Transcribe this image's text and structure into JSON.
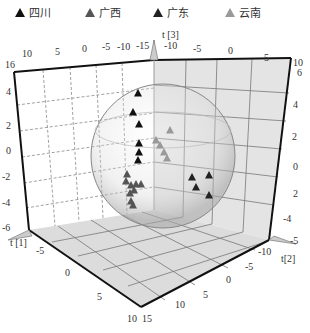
{
  "legend": [
    {
      "label": "四川",
      "color": "#111111"
    },
    {
      "label": "广西",
      "color": "#555555"
    },
    {
      "label": "广东",
      "color": "#222222"
    },
    {
      "label": "云南",
      "color": "#999999"
    }
  ],
  "axes": {
    "t1_label": "t [1]",
    "t2_label": "t[2]",
    "t3_label": "t [3]"
  },
  "chart_data": {
    "type": "scatter",
    "title": "",
    "dimensions": 3,
    "xlabel": "t[1]",
    "ylabel": "t[2]",
    "zlabel": "t[3]",
    "xlim": [
      -6,
      16
    ],
    "ylim": [
      -15,
      15
    ],
    "zlim": [
      -6,
      6
    ],
    "x_ticks_back": [
      "16",
      "10",
      "5",
      "0",
      "-5",
      "-10",
      "-15"
    ],
    "top_right_ticks": [
      "-10",
      "-5",
      "0",
      "5",
      "10"
    ],
    "left_z_ticks": [
      "4",
      "2",
      "0",
      "-2",
      "-4",
      "-6"
    ],
    "right_z_ticks": [
      "6",
      "4",
      "2",
      "0",
      "2",
      "-4",
      "-5"
    ],
    "bottom_t1_ticks": [
      "-5",
      "0",
      "5",
      "10"
    ],
    "bottom_t2_ticks": [
      "-10",
      "-5",
      "0",
      "5",
      "10",
      "15"
    ],
    "legend_position": "top",
    "grid": true,
    "confidence_ellipsoid": true,
    "series": [
      {
        "name": "四川",
        "color": "#111111",
        "points_2d": [
          [
            138,
            93
          ],
          [
            133,
            112
          ],
          [
            139,
            124
          ],
          [
            139,
            143
          ],
          [
            139,
            152
          ],
          [
            138,
            160
          ]
        ]
      },
      {
        "name": "广西",
        "color": "#555555",
        "points_2d": [
          [
            127,
            174
          ],
          [
            126,
            181
          ],
          [
            131,
            185
          ],
          [
            136,
            184
          ],
          [
            141,
            184
          ],
          [
            134,
            190
          ],
          [
            130,
            193
          ],
          [
            131,
            201
          ],
          [
            133,
            205
          ]
        ]
      },
      {
        "name": "广东",
        "color": "#222222",
        "points_2d": [
          [
            192,
            177
          ],
          [
            209,
            175
          ],
          [
            196,
            187
          ],
          [
            209,
            195
          ]
        ]
      },
      {
        "name": "云南",
        "color": "#999999",
        "points_2d": [
          [
            170,
            130
          ],
          [
            156,
            140
          ],
          [
            160,
            145
          ],
          [
            164,
            152
          ],
          [
            167,
            158
          ]
        ]
      }
    ]
  }
}
